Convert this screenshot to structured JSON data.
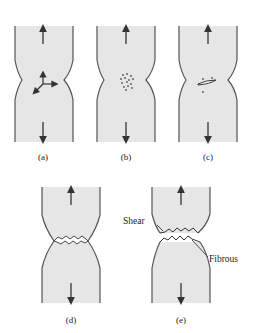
{
  "figure": {
    "panels": [
      {
        "id": "a",
        "caption": "(a)",
        "feature": "triaxial stress arrows at neck"
      },
      {
        "id": "b",
        "caption": "(b)",
        "feature": "microvoid formation"
      },
      {
        "id": "c",
        "caption": "(c)",
        "feature": "void coalescence into crack"
      },
      {
        "id": "d",
        "caption": "(d)",
        "feature": "crack propagation across neck"
      },
      {
        "id": "e",
        "caption": "(e)",
        "feature": "cup-and-cone fracture"
      }
    ],
    "annotations": {
      "shear": "Shear",
      "fibrous": "Fibrous"
    },
    "colors": {
      "specimen_fill": "#e6e6e6",
      "specimen_edge": "#555555",
      "arrow": "#333333"
    }
  }
}
